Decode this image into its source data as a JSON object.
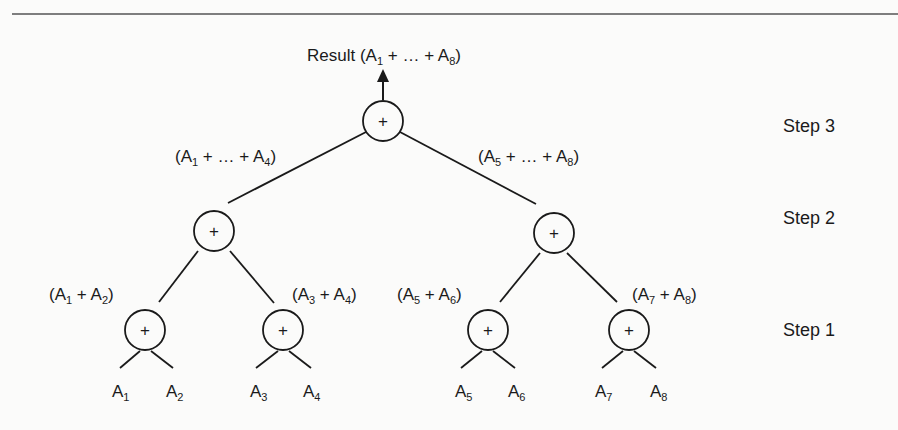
{
  "diagram": {
    "type": "binary-reduction-tree",
    "operator_symbol": "+",
    "result_label": "Result (A1 + … + A8)",
    "result_parts": {
      "prefix": "Result (A",
      "s1": "1",
      "mid": " + … + A",
      "s2": "8",
      "suffix": ")"
    },
    "steps": [
      {
        "label": "Step 3",
        "y": 132
      },
      {
        "label": "Step 2",
        "y": 242
      },
      {
        "label": "Step 1",
        "y": 336
      }
    ],
    "nodes": {
      "root": {
        "x": 383,
        "y": 121,
        "sum_label": "A1 + … + A8"
      },
      "level2": [
        {
          "x": 214,
          "y": 231,
          "label": {
            "a": "A",
            "s1": "1",
            "mid": " + … + A",
            "s2": "4",
            "text": "(A1 + … + A4)"
          }
        },
        {
          "x": 554,
          "y": 233,
          "label": {
            "a": "A",
            "s1": "5",
            "mid": " + … + A",
            "s2": "8",
            "text": "(A5 + … + A8)"
          }
        }
      ],
      "level1": [
        {
          "x": 145,
          "y": 330,
          "label": {
            "a": "A",
            "s1": "1",
            "mid": " + A",
            "s2": "2",
            "text": "(A1 + A2)"
          }
        },
        {
          "x": 283,
          "y": 330,
          "label": {
            "a": "A",
            "s1": "3",
            "mid": " + A",
            "s2": "4",
            "text": "(A3 + A4)"
          }
        },
        {
          "x": 488,
          "y": 330,
          "label": {
            "a": "A",
            "s1": "5",
            "mid": " + A",
            "s2": "6",
            "text": "(A5 + A6)"
          }
        },
        {
          "x": 629,
          "y": 330,
          "label": {
            "a": "A",
            "s1": "7",
            "mid": " + A",
            "s2": "8",
            "text": "(A7 + A8)"
          }
        }
      ],
      "leaves": [
        {
          "name": "A",
          "sub": "1"
        },
        {
          "name": "A",
          "sub": "2"
        },
        {
          "name": "A",
          "sub": "3"
        },
        {
          "name": "A",
          "sub": "4"
        },
        {
          "name": "A",
          "sub": "5"
        },
        {
          "name": "A",
          "sub": "6"
        },
        {
          "name": "A",
          "sub": "7"
        },
        {
          "name": "A",
          "sub": "8"
        }
      ]
    },
    "colors": {
      "ink": "#1a1a1a",
      "background": "#fbfbfa",
      "rule": "#555555"
    }
  }
}
